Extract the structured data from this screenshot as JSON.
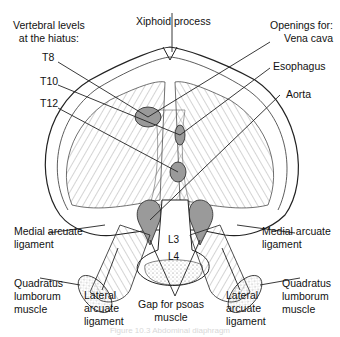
{
  "figure": {
    "caption": "Figure 10.3  Abdominal diaphragm",
    "labels": {
      "vertebral_header": [
        "Vertebral levels",
        "at the hiatus:"
      ],
      "t8": "T8",
      "t10": "T10",
      "t12": "T12",
      "xiphoid": "Xiphoid process",
      "openings_header": [
        "Openings for:",
        "Vena cava"
      ],
      "esophagus": "Esophagus",
      "aorta": "Aorta",
      "l3": "L3",
      "l4": "L4",
      "medial_arcuate_left": [
        "Medial arcuate",
        "ligament"
      ],
      "medial_arcuate_right": [
        "Medial arcuate",
        "ligament"
      ],
      "quadratus_left": [
        "Quadratus",
        "lumborum",
        "muscle"
      ],
      "quadratus_right": [
        "Quadratus",
        "lumborum",
        "muscle"
      ],
      "lateral_arcuate_left": [
        "Lateral",
        "arcuate",
        "ligament"
      ],
      "lateral_arcuate_right": [
        "Lateral",
        "arcuate",
        "ligament"
      ],
      "psoas_gap": [
        "Gap for psoas",
        "muscle"
      ]
    },
    "colors": {
      "opening_fill": "#9a9a9a",
      "line": "#222222"
    }
  }
}
